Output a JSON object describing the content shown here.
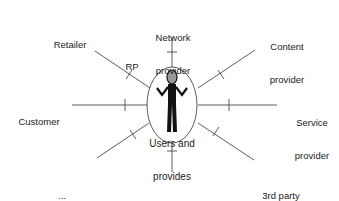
{
  "diagram": {
    "center": {
      "label_line1": "Users and",
      "label_line2": "provides",
      "icon": "person-shrug-icon"
    },
    "roles": [
      {
        "id": "network",
        "line1": "Network",
        "line2": "provider"
      },
      {
        "id": "content",
        "line1": "Content",
        "line2": "provider"
      },
      {
        "id": "service",
        "line1": "Service",
        "line2": "provider"
      },
      {
        "id": "third-party",
        "line1": "3rd party",
        "line2": "provider"
      },
      {
        "id": "broker",
        "line1": "Broker",
        "line2": ""
      },
      {
        "id": "more",
        "line1": "...",
        "line2": ""
      },
      {
        "id": "customer",
        "line1": "Customer",
        "line2": ""
      },
      {
        "id": "retailer",
        "line1": "Retailer",
        "line2": ""
      }
    ],
    "reference_point_label": "RP",
    "colors": {
      "line": "#333333",
      "background": "#ffffff"
    }
  }
}
